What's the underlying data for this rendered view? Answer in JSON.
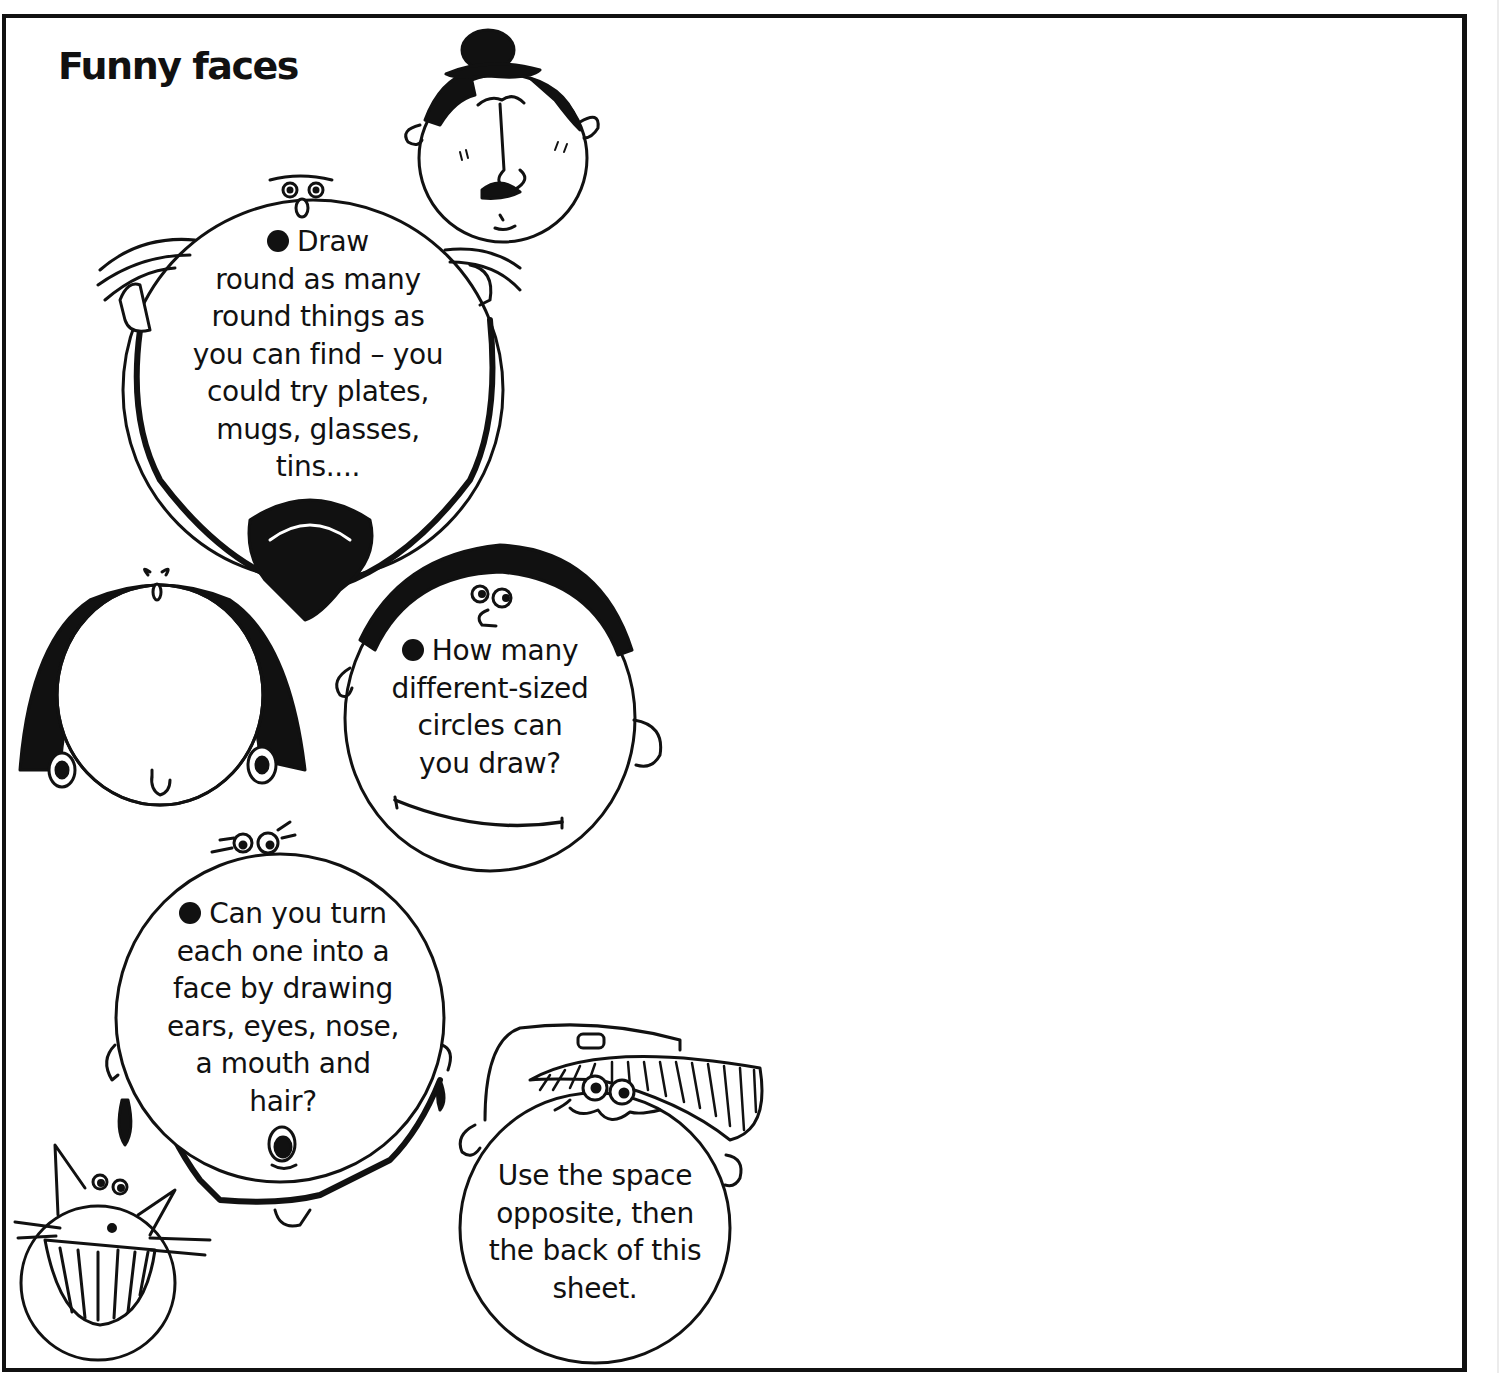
{
  "worksheet": {
    "title": "Funny faces",
    "instructions": [
      {
        "bullet": true,
        "lines": [
          "Draw",
          "round as many",
          "round things as",
          "you can find – you",
          "could try plates,",
          "mugs, glasses,",
          "tins...."
        ]
      },
      {
        "bullet": true,
        "lines": [
          "How many",
          "different-sized",
          "circles can",
          "you draw?"
        ]
      },
      {
        "bullet": true,
        "lines": [
          "Can you turn",
          "each one into a",
          "face by drawing",
          "ears, eyes, nose,",
          "a mouth and",
          "hair?"
        ]
      },
      {
        "bullet": false,
        "lines": [
          "Use the space",
          "opposite, then",
          "the back of this",
          "sheet."
        ]
      }
    ],
    "illustrations": [
      {
        "name": "bowler-hat-moustache-face"
      },
      {
        "name": "bearded-face"
      },
      {
        "name": "curly-hair-face"
      },
      {
        "name": "curly-top-face"
      },
      {
        "name": "earring-face"
      },
      {
        "name": "grinning-cat-face"
      },
      {
        "name": "cap-face"
      }
    ],
    "colors": {
      "ink": "#111111",
      "paper": "#ffffff"
    }
  }
}
